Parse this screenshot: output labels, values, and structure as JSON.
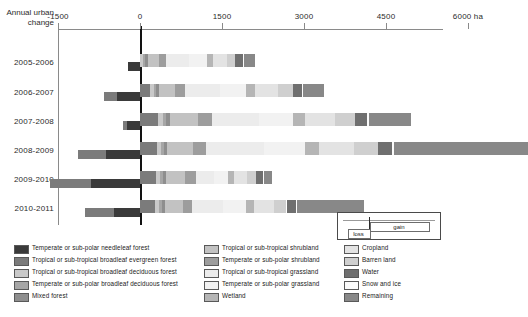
{
  "axis": {
    "y_title": "Annual urban change",
    "unit": "ha",
    "ticks": [
      {
        "label": "-1500",
        "value": -1500
      },
      {
        "label": "0",
        "value": 0
      },
      {
        "label": "1500",
        "value": 1500
      },
      {
        "label": "3000",
        "value": 3000
      },
      {
        "label": "4500",
        "value": 4500
      },
      {
        "label": "6000",
        "value": 6000
      }
    ],
    "unit_label": "ha"
  },
  "inset": {
    "loss_label": "loss",
    "gain_label": "gain"
  },
  "legend": {
    "columns": [
      [
        {
          "label": "Temperate or sub-polar needleleaf forest",
          "color": "#3a3a3a"
        },
        {
          "label": "Tropical or sub-tropical broadleaf evergreen forest",
          "color": "#7b7b7b"
        },
        {
          "label": "Tropical or sub-tropical broadleaf deciduous forest",
          "color": "#c9c9c9"
        },
        {
          "label": "Temperate or sub-polar broadleaf deciduous forest",
          "color": "#a6a6a6"
        },
        {
          "label": "Mixed forest",
          "color": "#8e8e8e"
        }
      ],
      [
        {
          "label": "Tropical or sub-tropical shrubland",
          "color": "#c2c2c2"
        },
        {
          "label": "Temperate or sub-polar shrubland",
          "color": "#9d9d9d"
        },
        {
          "label": "Tropical or sub-tropical grassland",
          "color": "#ececec"
        },
        {
          "label": "Temperate or sub-polar grassland",
          "color": "#f2f2f2"
        },
        {
          "label": "Wetland",
          "color": "#b5b5b5"
        }
      ],
      [
        {
          "label": "Cropland",
          "color": "#e3e3e3"
        },
        {
          "label": "Barren land",
          "color": "#cfcfcf"
        },
        {
          "label": "Water",
          "color": "#6f6f6f"
        },
        {
          "label": "Snow and ice",
          "color": "#fbfbfb"
        },
        {
          "label": "Remaining",
          "color": "#888888"
        }
      ]
    ]
  },
  "chart_data": {
    "type": "bar",
    "orientation": "horizontal",
    "stacked": true,
    "title": "Annual urban change",
    "xlabel": "ha",
    "ylabel": "Annual urban change",
    "xlim": [
      -1800,
      6400
    ],
    "grid": false,
    "legend_position": "below",
    "categories": [
      "2005-2006",
      "2006-2007",
      "2007-2008",
      "2008-2009",
      "2009-2010",
      "2010-2011"
    ],
    "series": [
      {
        "name": "Temperate or sub-polar needleleaf forest",
        "color": "#3a3a3a",
        "gain": [
          0,
          0,
          0,
          0,
          0,
          0
        ],
        "loss": [
          -220,
          -420,
          -230,
          -630,
          -900,
          -480
        ]
      },
      {
        "name": "Tropical or sub-tropical broadleaf evergreen forest",
        "color": "#7b7b7b",
        "gain": [
          0,
          190,
          330,
          310,
          300,
          280
        ],
        "loss": [
          0,
          -230,
          -90,
          -500,
          -740,
          -520
        ]
      },
      {
        "name": "Tropical or sub-tropical broadleaf deciduous forest",
        "color": "#c9c9c9",
        "gain": [
          60,
          60,
          90,
          80,
          70,
          70
        ],
        "loss": [
          0,
          0,
          0,
          0,
          0,
          0
        ]
      },
      {
        "name": "Temperate or sub-polar broadleaf deciduous forest",
        "color": "#a6a6a6",
        "gain": [
          40,
          40,
          60,
          50,
          50,
          50
        ],
        "loss": [
          0,
          0,
          0,
          0,
          0,
          0
        ]
      },
      {
        "name": "Mixed forest",
        "color": "#8e8e8e",
        "gain": [
          40,
          50,
          60,
          60,
          50,
          50
        ],
        "loss": [
          0,
          0,
          0,
          0,
          0,
          0
        ]
      },
      {
        "name": "Tropical or sub-tropical shrubland",
        "color": "#c2c2c2",
        "gain": [
          210,
          300,
          520,
          470,
          360,
          330
        ],
        "loss": [
          0,
          0,
          0,
          0,
          0,
          0
        ]
      },
      {
        "name": "Temperate or sub-polar shrubland",
        "color": "#9d9d9d",
        "gain": [
          120,
          180,
          260,
          240,
          190,
          180
        ],
        "loss": [
          0,
          0,
          0,
          0,
          0,
          0
        ]
      },
      {
        "name": "Tropical or sub-tropical grassland",
        "color": "#ececec",
        "gain": [
          420,
          640,
          850,
          1050,
          330,
          560
        ],
        "loss": [
          0,
          0,
          0,
          0,
          0,
          0
        ]
      },
      {
        "name": "Temperate or sub-polar grassland",
        "color": "#f2f2f2",
        "gain": [
          330,
          480,
          620,
          760,
          260,
          420
        ],
        "loss": [
          0,
          0,
          0,
          0,
          0,
          0
        ]
      },
      {
        "name": "Wetland",
        "color": "#b5b5b5",
        "gain": [
          120,
          170,
          220,
          260,
          110,
          150
        ],
        "loss": [
          0,
          0,
          0,
          0,
          0,
          0
        ]
      },
      {
        "name": "Cropland",
        "color": "#e3e3e3",
        "gain": [
          260,
          420,
          560,
          640,
          240,
          360
        ],
        "loss": [
          0,
          0,
          0,
          0,
          0,
          0
        ]
      },
      {
        "name": "Barren land",
        "color": "#cfcfcf",
        "gain": [
          140,
          260,
          360,
          430,
          160,
          230
        ],
        "loss": [
          0,
          0,
          0,
          0,
          0,
          0
        ]
      },
      {
        "name": "Water",
        "color": "#6f6f6f",
        "gain": [
          150,
          180,
          230,
          260,
          130,
          170
        ],
        "loss": [
          0,
          0,
          0,
          0,
          0,
          0
        ]
      },
      {
        "name": "Snow and ice",
        "color": "#fbfbfb",
        "gain": [
          20,
          20,
          30,
          30,
          20,
          20
        ],
        "loss": [
          0,
          0,
          0,
          0,
          0,
          0
        ]
      },
      {
        "name": "Remaining",
        "color": "#888888",
        "gain": [
          190,
          380,
          760,
          2450,
          140,
          1230
        ],
        "loss": [
          0,
          0,
          0,
          0,
          0,
          0
        ]
      }
    ],
    "row_totals_gain": [
      2100,
      3370,
      4950,
      7090,
      2410,
      4100
    ],
    "row_totals_loss": [
      -220,
      -650,
      -320,
      -1130,
      -1640,
      -1000
    ]
  }
}
